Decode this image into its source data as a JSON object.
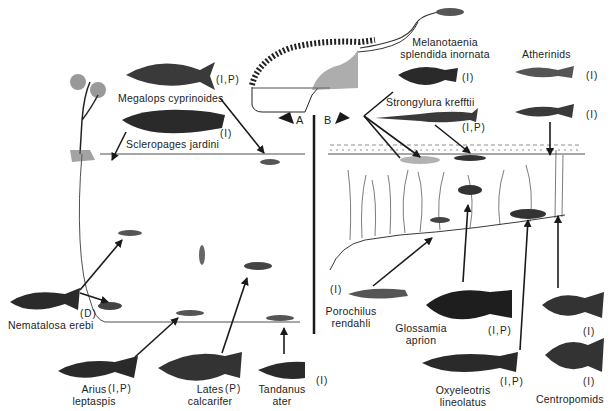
{
  "figure": {
    "panels": {
      "a": "A",
      "b": "B"
    },
    "left_species": [
      {
        "id": "megalops",
        "name": "Megalops cyprinoides",
        "diet": "(I,P)"
      },
      {
        "id": "scleropages",
        "name": "Scleropages jardini",
        "diet": "(I)"
      },
      {
        "id": "nematalosa",
        "name": "Nematalosa erebi",
        "diet": "(D)"
      },
      {
        "id": "arius",
        "name_line1": "Arius",
        "name_line2": "leptaspis",
        "diet": "(I,P)"
      },
      {
        "id": "lates",
        "name_line1": "Lates",
        "name_line2": "calcarifer",
        "diet": "(P)"
      },
      {
        "id": "tandanus",
        "name_line1": "Tandanus",
        "name_line2": "ater",
        "diet": "(I)"
      }
    ],
    "right_species": [
      {
        "id": "melanotaenia",
        "name_line1": "Melanotaenia",
        "name_line2": "splendida inornata",
        "diet": "(I)"
      },
      {
        "id": "atherinids",
        "name": "Atherinids",
        "diet_1": "(I)",
        "diet_2": "(I)"
      },
      {
        "id": "strongylura",
        "name": "Strongylura krefftii",
        "diet": "(I,P)"
      },
      {
        "id": "porochilus",
        "name_line1": "Porochilus",
        "name_line2": "rendahli",
        "diet": "(I)"
      },
      {
        "id": "glossamia",
        "name_line1": "Glossamia",
        "name_line2": "aprion",
        "diet": "(I,P)"
      },
      {
        "id": "oxyeleotris",
        "name_line1": "Oxyeleotris",
        "name_line2": "lineolatus",
        "diet": "(I,P)"
      },
      {
        "id": "centropomids",
        "name": "Centropomids",
        "diet_1": "(I)",
        "diet_2": "(I)"
      }
    ],
    "colors": {
      "ink": "#1a1a1a",
      "paper": "#ffffff"
    }
  }
}
